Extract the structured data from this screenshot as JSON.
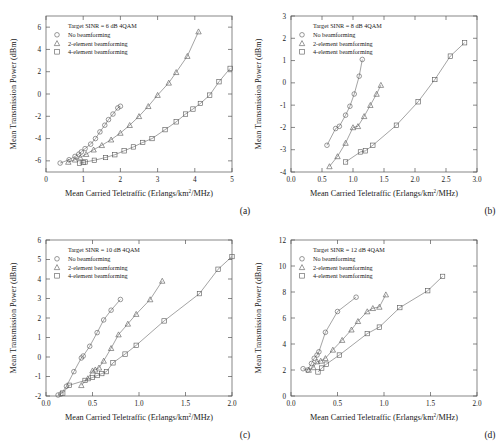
{
  "figure": {
    "panels": [
      {
        "id": "a",
        "caption": "(a)",
        "legend_title": "Target SINR = 6 dB 4QAM",
        "legend": [
          {
            "marker": "circle",
            "label": "No beamforming"
          },
          {
            "marker": "triangle",
            "label": "2-element beamforming"
          },
          {
            "marker": "square",
            "label": "4-element beamforming"
          }
        ],
        "xlabel_main": "Mean Carried Teletraffic (Erlangs/km",
        "xlabel_sup": "2",
        "xlabel_tail": "/MHz)",
        "ylabel": "Mean Transmission Power (dBm)",
        "xticks": [
          "0",
          "1",
          "2",
          "3",
          "4",
          "5"
        ],
        "yticks": [
          "-6",
          "-4",
          "-2",
          "0",
          "2",
          "4",
          "6"
        ]
      },
      {
        "id": "b",
        "caption": "(b)",
        "legend_title": "Target SINR = 8 dB 4QAM",
        "legend": [
          {
            "marker": "circle",
            "label": "No beamforming"
          },
          {
            "marker": "triangle",
            "label": "2-element beamforming"
          },
          {
            "marker": "square",
            "label": "4-element beamforming"
          }
        ],
        "xlabel_main": "Mean Carried Teletraffic (Erlangs/km",
        "xlabel_sup": "2",
        "xlabel_tail": "/MHz)",
        "ylabel": "Mean Transmission Power (dBm)",
        "xticks": [
          "0.0",
          "0.5",
          "1.0",
          "1.5",
          "2.0",
          "2.5",
          "3.0"
        ],
        "yticks": [
          "-4",
          "-3",
          "-2",
          "-1",
          "0",
          "1",
          "2",
          "3"
        ]
      },
      {
        "id": "c",
        "caption": "(c)",
        "legend_title": "Target SINR = 10 dB 4QAM",
        "legend": [
          {
            "marker": "circle",
            "label": "No beamforming"
          },
          {
            "marker": "triangle",
            "label": "2-element beamforming"
          },
          {
            "marker": "square",
            "label": "4-element beamforming"
          }
        ],
        "xlabel_main": "Mean Carried Teletraffic (Erlangs/km",
        "xlabel_sup": "2",
        "xlabel_tail": "/MHz)",
        "ylabel": "Mean Transmission Power (dBm)",
        "xticks": [
          "0.0",
          "0.5",
          "1.0",
          "1.5",
          "2.0"
        ],
        "yticks": [
          "-2",
          "-1",
          "0",
          "1",
          "2",
          "3",
          "4",
          "5",
          "6"
        ]
      },
      {
        "id": "d",
        "caption": "(d)",
        "legend_title": "Target SINR = 12 dB 4QAM",
        "legend": [
          {
            "marker": "circle",
            "label": "No beamforming"
          },
          {
            "marker": "triangle",
            "label": "2-element beamforming"
          },
          {
            "marker": "square",
            "label": "4-element beamforming"
          }
        ],
        "xlabel_main": "Mean Carried Teletraffic (Erlangs/km",
        "xlabel_sup": "2",
        "xlabel_tail": "/MHz)",
        "ylabel": "Mean Transmission Power (dBm)",
        "xticks": [
          "0.0",
          "0.5",
          "1.0",
          "1.5",
          "2.0"
        ],
        "yticks": [
          "0",
          "2",
          "4",
          "6",
          "8",
          "10",
          "12"
        ]
      }
    ]
  },
  "chart_data": [
    {
      "type": "line",
      "panel": "a",
      "title": "Target SINR = 6 dB 4QAM",
      "xlabel": "Mean Carried Teletraffic (Erlangs/km^2/MHz)",
      "ylabel": "Mean Transmission Power (dBm)",
      "xlim": [
        0,
        5
      ],
      "ylim": [
        -7,
        7
      ],
      "xticks": [
        0,
        1,
        2,
        3,
        4,
        5
      ],
      "yticks": [
        -6,
        -4,
        -2,
        0,
        2,
        4,
        6
      ],
      "grid": false,
      "legend_position": "upper-left",
      "series": [
        {
          "name": "No beamforming",
          "marker": "circle",
          "points": [
            [
              0.38,
              -6.2
            ],
            [
              0.62,
              -5.9
            ],
            [
              0.78,
              -5.6
            ],
            [
              0.88,
              -5.4
            ],
            [
              0.95,
              -5.2
            ],
            [
              1.05,
              -4.9
            ],
            [
              1.2,
              -4.5
            ],
            [
              1.33,
              -4.0
            ],
            [
              1.45,
              -3.4
            ],
            [
              1.58,
              -2.8
            ],
            [
              1.68,
              -2.3
            ],
            [
              1.8,
              -1.8
            ],
            [
              1.93,
              -1.25
            ],
            [
              2.0,
              -1.1
            ]
          ]
        },
        {
          "name": "2-element beamforming",
          "marker": "triangle",
          "points": [
            [
              0.6,
              -6.1
            ],
            [
              0.78,
              -5.9
            ],
            [
              0.92,
              -5.7
            ],
            [
              1.08,
              -5.4
            ],
            [
              1.28,
              -5.0
            ],
            [
              1.5,
              -4.6
            ],
            [
              1.75,
              -4.1
            ],
            [
              2.0,
              -3.5
            ],
            [
              2.25,
              -2.8
            ],
            [
              2.5,
              -2.0
            ],
            [
              2.75,
              -1.1
            ],
            [
              3.0,
              -0.1
            ],
            [
              3.3,
              1.0
            ],
            [
              3.5,
              1.95
            ],
            [
              3.8,
              3.4
            ],
            [
              4.1,
              5.6
            ]
          ]
        },
        {
          "name": "4-element beamforming",
          "marker": "square",
          "points": [
            [
              0.9,
              -6.2
            ],
            [
              1.0,
              -6.15
            ],
            [
              1.05,
              -6.1
            ],
            [
              1.3,
              -5.95
            ],
            [
              1.6,
              -5.7
            ],
            [
              1.85,
              -5.45
            ],
            [
              2.1,
              -5.1
            ],
            [
              2.35,
              -4.75
            ],
            [
              2.6,
              -4.35
            ],
            [
              2.85,
              -4.0
            ],
            [
              3.2,
              -3.2
            ],
            [
              3.5,
              -2.5
            ],
            [
              3.75,
              -1.8
            ],
            [
              3.95,
              -1.35
            ],
            [
              4.15,
              -0.85
            ],
            [
              4.4,
              -0.1
            ],
            [
              4.65,
              1.1
            ],
            [
              4.95,
              2.3
            ]
          ]
        }
      ]
    },
    {
      "type": "line",
      "panel": "b",
      "title": "Target SINR = 8 dB 4QAM",
      "xlabel": "Mean Carried Teletraffic (Erlangs/km^2/MHz)",
      "ylabel": "Mean Transmission Power (dBm)",
      "xlim": [
        0.0,
        3.0
      ],
      "ylim": [
        -4,
        3
      ],
      "xticks": [
        0.0,
        0.5,
        1.0,
        1.5,
        2.0,
        2.5,
        3.0
      ],
      "yticks": [
        -4,
        -3,
        -2,
        -1,
        0,
        1,
        2,
        3
      ],
      "grid": false,
      "legend_position": "upper-left",
      "series": [
        {
          "name": "No beamforming",
          "marker": "circle",
          "points": [
            [
              0.58,
              -2.8
            ],
            [
              0.72,
              -2.05
            ],
            [
              0.78,
              -1.95
            ],
            [
              0.88,
              -1.45
            ],
            [
              0.95,
              -1.05
            ],
            [
              1.02,
              -0.5
            ],
            [
              1.1,
              0.3
            ],
            [
              1.15,
              1.05
            ]
          ]
        },
        {
          "name": "2-element beamforming",
          "marker": "triangle",
          "points": [
            [
              0.62,
              -3.75
            ],
            [
              0.75,
              -3.3
            ],
            [
              0.88,
              -2.7
            ],
            [
              1.0,
              -2.0
            ],
            [
              1.08,
              -1.95
            ],
            [
              1.18,
              -1.5
            ],
            [
              1.28,
              -1.0
            ],
            [
              1.38,
              -0.5
            ],
            [
              1.45,
              -0.1
            ]
          ]
        },
        {
          "name": "4-element beamforming",
          "marker": "square",
          "points": [
            [
              0.88,
              -3.55
            ],
            [
              1.12,
              -3.1
            ],
            [
              1.2,
              -3.05
            ],
            [
              1.32,
              -2.8
            ],
            [
              1.7,
              -1.9
            ],
            [
              2.05,
              -0.85
            ],
            [
              2.32,
              0.15
            ],
            [
              2.57,
              1.2
            ],
            [
              2.8,
              1.8
            ]
          ]
        }
      ]
    },
    {
      "type": "line",
      "panel": "c",
      "title": "Target SINR = 10 dB 4QAM",
      "xlabel": "Mean Carried Teletraffic (Erlangs/km^2/MHz)",
      "ylabel": "Mean Transmission Power (dBm)",
      "xlim": [
        0.0,
        2.0
      ],
      "ylim": [
        -2,
        6
      ],
      "xticks": [
        0.0,
        0.5,
        1.0,
        1.5,
        2.0
      ],
      "yticks": [
        -2,
        -1,
        0,
        1,
        2,
        3,
        4,
        5,
        6
      ],
      "grid": false,
      "legend_position": "upper-left",
      "series": [
        {
          "name": "No beamforming",
          "marker": "circle",
          "points": [
            [
              0.13,
              -1.95
            ],
            [
              0.16,
              -1.9
            ],
            [
              0.22,
              -1.5
            ],
            [
              0.3,
              -0.75
            ],
            [
              0.38,
              -0.05
            ],
            [
              0.4,
              0.05
            ],
            [
              0.47,
              0.55
            ],
            [
              0.55,
              1.25
            ],
            [
              0.62,
              1.9
            ],
            [
              0.7,
              2.4
            ],
            [
              0.8,
              2.95
            ]
          ]
        },
        {
          "name": "2-element beamforming",
          "marker": "triangle",
          "points": [
            [
              0.38,
              -1.45
            ],
            [
              0.45,
              -1.1
            ],
            [
              0.5,
              -0.7
            ],
            [
              0.53,
              -0.65
            ],
            [
              0.57,
              -0.55
            ],
            [
              0.62,
              -0.2
            ],
            [
              0.7,
              0.45
            ],
            [
              0.78,
              1.15
            ],
            [
              0.88,
              1.7
            ],
            [
              0.97,
              2.2
            ],
            [
              1.12,
              2.95
            ],
            [
              1.25,
              3.9
            ]
          ]
        },
        {
          "name": "4-element beamforming",
          "marker": "square",
          "points": [
            [
              0.18,
              -1.85
            ],
            [
              0.25,
              -1.45
            ],
            [
              0.42,
              -1.2
            ],
            [
              0.5,
              -1.05
            ],
            [
              0.55,
              -0.95
            ],
            [
              0.6,
              -0.85
            ],
            [
              0.65,
              -0.75
            ],
            [
              0.72,
              -0.3
            ],
            [
              0.85,
              0.15
            ],
            [
              0.97,
              0.6
            ],
            [
              1.27,
              1.85
            ],
            [
              1.65,
              3.25
            ],
            [
              1.85,
              4.5
            ],
            [
              2.0,
              5.15
            ]
          ]
        }
      ]
    },
    {
      "type": "line",
      "panel": "d",
      "title": "Target SINR = 12 dB 4QAM",
      "xlabel": "Mean Carried Teletraffic (Erlangs/km^2/MHz)",
      "ylabel": "Mean Transmission Power (dBm)",
      "xlim": [
        0.0,
        2.0
      ],
      "ylim": [
        0,
        12
      ],
      "xticks": [
        0.0,
        0.5,
        1.0,
        1.5,
        2.0
      ],
      "yticks": [
        0,
        2,
        4,
        6,
        8,
        10,
        12
      ],
      "grid": false,
      "legend_position": "upper-left",
      "series": [
        {
          "name": "No beamforming",
          "marker": "circle",
          "points": [
            [
              0.13,
              2.1
            ],
            [
              0.18,
              2.0
            ],
            [
              0.22,
              2.5
            ],
            [
              0.25,
              2.9
            ],
            [
              0.28,
              3.15
            ],
            [
              0.3,
              3.4
            ],
            [
              0.37,
              4.9
            ],
            [
              0.5,
              6.5
            ],
            [
              0.7,
              7.6
            ]
          ]
        },
        {
          "name": "2-element beamforming",
          "marker": "triangle",
          "points": [
            [
              0.19,
              2.0
            ],
            [
              0.24,
              2.2
            ],
            [
              0.28,
              2.65
            ],
            [
              0.32,
              2.7
            ],
            [
              0.37,
              2.9
            ],
            [
              0.45,
              3.55
            ],
            [
              0.55,
              4.3
            ],
            [
              0.65,
              5.1
            ],
            [
              0.72,
              5.75
            ],
            [
              0.82,
              6.5
            ],
            [
              0.88,
              6.75
            ],
            [
              0.95,
              6.85
            ],
            [
              1.02,
              7.8
            ]
          ]
        },
        {
          "name": "4-element beamforming",
          "marker": "square",
          "points": [
            [
              0.29,
              1.85
            ],
            [
              0.33,
              2.15
            ],
            [
              0.38,
              2.45
            ],
            [
              0.52,
              3.15
            ],
            [
              0.82,
              4.8
            ],
            [
              0.95,
              5.3
            ],
            [
              1.17,
              6.8
            ],
            [
              1.47,
              8.1
            ],
            [
              1.63,
              9.2
            ]
          ]
        }
      ]
    }
  ]
}
